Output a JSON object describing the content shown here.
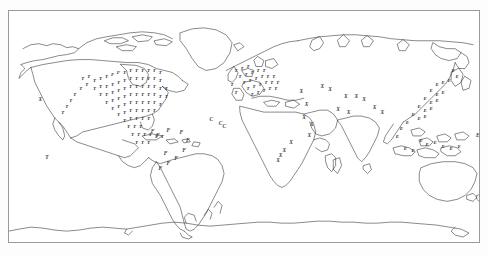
{
  "page": {
    "top_caption": "",
    "background_color": "#fdfdfd",
    "frame_color": "#9a9a9a",
    "coast_color": "#2a2a2a",
    "marker_color": "#3b3b3b"
  },
  "map": {
    "title": "",
    "projection": "equirectangular",
    "lon_range": [
      -180,
      180
    ],
    "lat_range": [
      -90,
      90
    ],
    "frame": {
      "x": 8,
      "y": 10,
      "width": 472,
      "height": 233
    }
  },
  "legend": {
    "symbols": [
      "T",
      "F",
      "X",
      "C",
      "E"
    ]
  },
  "chart_data": {
    "type": "scatter",
    "title": "",
    "xlabel": "",
    "ylabel": "",
    "xlim": [
      -180,
      180
    ],
    "ylim": [
      -90,
      90
    ],
    "grid": false,
    "legend_position": "none",
    "symbol_labels": [
      "T",
      "F",
      "X",
      "C",
      "E"
    ],
    "series": [
      {
        "name": "ocean-markers",
        "points": [
          {
            "x": -156,
            "y": 20,
            "label": "X"
          },
          {
            "x": -151,
            "y": -25,
            "label": "T"
          },
          {
            "x": 179,
            "y": -8,
            "label": "E"
          },
          {
            "x": -25,
            "y": 4,
            "label": "C"
          },
          {
            "x": -18,
            "y": 1,
            "label": "C"
          },
          {
            "x": -15,
            "y": -1,
            "label": "C"
          }
        ]
      },
      {
        "name": "asia-africa-x-markers",
        "points": [
          {
            "x": 44,
            "y": 26,
            "label": "X"
          },
          {
            "x": 48,
            "y": 16,
            "label": "X"
          },
          {
            "x": 46,
            "y": 6,
            "label": "X"
          },
          {
            "x": 52,
            "y": 0,
            "label": "X"
          },
          {
            "x": 50,
            "y": -8,
            "label": "X"
          },
          {
            "x": 36,
            "y": -14,
            "label": "X"
          },
          {
            "x": 31,
            "y": -20,
            "label": "X"
          },
          {
            "x": 28,
            "y": -24,
            "label": "X"
          },
          {
            "x": 26,
            "y": -28,
            "label": "X"
          },
          {
            "x": 78,
            "y": 22,
            "label": "X"
          },
          {
            "x": 86,
            "y": 22,
            "label": "X"
          },
          {
            "x": 92,
            "y": 20,
            "label": "X"
          },
          {
            "x": 72,
            "y": 12,
            "label": "X"
          },
          {
            "x": 80,
            "y": 10,
            "label": "X"
          },
          {
            "x": 66,
            "y": 28,
            "label": "X"
          },
          {
            "x": 60,
            "y": 30,
            "label": "X"
          },
          {
            "x": 100,
            "y": 14,
            "label": "X"
          },
          {
            "x": 106,
            "y": 10,
            "label": "X"
          }
        ]
      },
      {
        "name": "south-america-f-markers",
        "points": [
          {
            "x": -70,
            "y": -5,
            "label": "F"
          },
          {
            "x": -66,
            "y": -8,
            "label": "F"
          },
          {
            "x": -58,
            "y": -4,
            "label": "F"
          },
          {
            "x": -48,
            "y": -6,
            "label": "F"
          },
          {
            "x": -43,
            "y": -12,
            "label": "F"
          },
          {
            "x": -46,
            "y": -20,
            "label": "F"
          },
          {
            "x": -52,
            "y": -26,
            "label": "F"
          },
          {
            "x": -58,
            "y": -30,
            "label": "F"
          },
          {
            "x": -64,
            "y": -34,
            "label": "F"
          },
          {
            "x": -60,
            "y": -22,
            "label": "F"
          }
        ]
      },
      {
        "name": "north-america-dense-cluster",
        "description": "Very dense overlapping point markers across the contiguous United States, southern Canada, Mexico and the Caribbean",
        "density": "very-high",
        "bbox": [
          -125,
          14,
          -65,
          52
        ]
      },
      {
        "name": "europe-dense-cluster",
        "description": "Dense overlapping point markers across western and central Europe",
        "density": "high",
        "bbox": [
          -10,
          36,
          30,
          60
        ]
      },
      {
        "name": "east-asia-dense-cluster",
        "description": "Dense overlapping point markers across eastern China, Korea, Japan and Southeast Asia",
        "density": "high",
        "bbox": [
          95,
          -10,
          145,
          45
        ]
      },
      {
        "name": "australia-coastal-markers",
        "description": "Scattered markers along the eastern and southern Australian coast and New Zealand",
        "density": "low",
        "bbox": [
          113,
          -45,
          178,
          -10
        ]
      }
    ]
  }
}
